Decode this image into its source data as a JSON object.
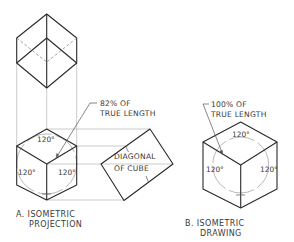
{
  "figure": {
    "panel_a": {
      "caption_line1": "A. ISOMETRIC",
      "caption_line2": "PROJECTION",
      "leader_line1": "82% OF",
      "leader_line2": "TRUE LENGTH",
      "diagonal_line1": "DIAGONAL",
      "diagonal_line2": "OF CUBE",
      "angle_top": "120°",
      "angle_left": "120°",
      "angle_right": "120°"
    },
    "panel_b": {
      "caption_line1": "B. ISOMETRIC",
      "caption_line2": "DRAWING",
      "leader_line1": "100% OF",
      "leader_line2": "TRUE LENGTH",
      "angle_top": "120°",
      "angle_left": "120°",
      "angle_right": "120°"
    }
  }
}
